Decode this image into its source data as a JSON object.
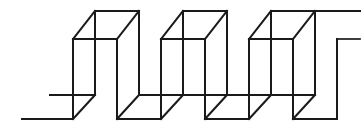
{
  "figure": {
    "title": "Impossible square-wave figure",
    "kind": "line-drawing",
    "background_color": "#ffffff",
    "ink_color": "#1a1a1a",
    "stroke_width": 2,
    "canvas": {
      "width": 364,
      "height": 135
    },
    "geometry": {
      "period": 92,
      "depth_dx": 22,
      "depth_dy": -28,
      "y_top_back": 11,
      "y_top_front": 39,
      "y_mid": 95,
      "y_bottom_front": 119,
      "unit_count": 3,
      "left_entry_x": 22,
      "mid_stub_x": 50,
      "right_exit_x": 358
    },
    "elements": {
      "left_entry_line": "lower-left horizontal lead-in",
      "left_mid_line": "left mid-level horizontal",
      "unit_1": "first box unit",
      "unit_2": "second box unit",
      "unit_3": "third box unit",
      "right_exit_upper": "upper right horizontal lead-out",
      "right_exit_lower": "front-top right horizontal lead-out"
    }
  }
}
